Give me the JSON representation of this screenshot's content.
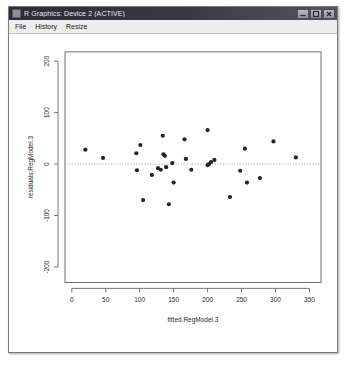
{
  "window": {
    "title": "R Graphics: Device 2 (ACTIVE)",
    "icon": "chart-icon",
    "controls": [
      {
        "name": "minimize-button",
        "glyph": "minimize-icon"
      },
      {
        "name": "maximize-button",
        "glyph": "maximize-icon"
      },
      {
        "name": "close-button",
        "glyph": "close-icon"
      }
    ]
  },
  "menu": {
    "items": [
      {
        "label": "File"
      },
      {
        "label": "History"
      },
      {
        "label": "Resize"
      }
    ]
  },
  "chart_data": {
    "type": "scatter",
    "title": "",
    "xlabel": "fitted.RegModel.3",
    "ylabel": "residuals.RegModel.3",
    "xlim": [
      -10,
      367
    ],
    "ylim": [
      -230,
      218
    ],
    "xticks": [
      0,
      50,
      100,
      150,
      200,
      250,
      300,
      350
    ],
    "yticks": [
      -200,
      -100,
      0,
      100,
      200
    ],
    "grid": false,
    "legend": null,
    "reference_line": {
      "type": "hline",
      "y": 0,
      "style": "dotted",
      "color": "#9a9a9a"
    },
    "point_color": "#242424",
    "point_size": 2.1,
    "points": [
      {
        "x": 20,
        "y": 28
      },
      {
        "x": 46,
        "y": 12
      },
      {
        "x": 95,
        "y": 21
      },
      {
        "x": 96,
        "y": -12
      },
      {
        "x": 101,
        "y": 37
      },
      {
        "x": 105,
        "y": -70
      },
      {
        "x": 118,
        "y": -21
      },
      {
        "x": 127,
        "y": -8
      },
      {
        "x": 131,
        "y": -11
      },
      {
        "x": 134,
        "y": 55
      },
      {
        "x": 135,
        "y": 19
      },
      {
        "x": 137,
        "y": 16
      },
      {
        "x": 139,
        "y": -6
      },
      {
        "x": 143,
        "y": -78
      },
      {
        "x": 148,
        "y": 2
      },
      {
        "x": 150,
        "y": -36
      },
      {
        "x": 166,
        "y": 48
      },
      {
        "x": 168,
        "y": 10
      },
      {
        "x": 176,
        "y": -11
      },
      {
        "x": 200,
        "y": 66
      },
      {
        "x": 200,
        "y": -2
      },
      {
        "x": 202,
        "y": 0
      },
      {
        "x": 205,
        "y": 4
      },
      {
        "x": 210,
        "y": 8
      },
      {
        "x": 233,
        "y": -64
      },
      {
        "x": 248,
        "y": -13
      },
      {
        "x": 255,
        "y": 30
      },
      {
        "x": 258,
        "y": -36
      },
      {
        "x": 277,
        "y": -27
      },
      {
        "x": 297,
        "y": 44
      },
      {
        "x": 330,
        "y": 13
      }
    ]
  }
}
